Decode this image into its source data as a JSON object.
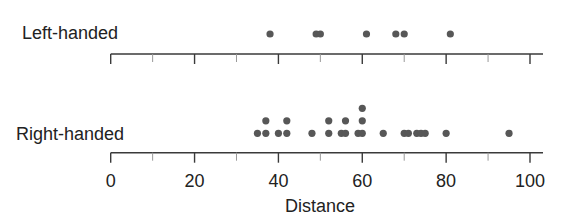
{
  "chart_data": {
    "type": "scatter",
    "subtype": "dot-plot",
    "title": "",
    "xlabel": "Distance",
    "ylabel": "",
    "xlim": [
      0,
      100
    ],
    "x_ticks_major": [
      0,
      20,
      40,
      60,
      80,
      100
    ],
    "x_ticks_minor": [
      10,
      30,
      50,
      70,
      90
    ],
    "grid": false,
    "legend": null,
    "series": [
      {
        "name": "Left-handed",
        "values": [
          38,
          49,
          50,
          61,
          68,
          70,
          81
        ]
      },
      {
        "name": "Right-handed",
        "values": [
          35,
          37,
          37,
          40,
          42,
          42,
          48,
          52,
          52,
          55,
          56,
          56,
          59,
          60,
          60,
          60,
          65,
          70,
          71,
          73,
          74,
          75,
          80,
          95
        ]
      }
    ],
    "colors": {
      "dot": "#575757",
      "axis": "#3a3a3a",
      "text": "#222222"
    }
  }
}
